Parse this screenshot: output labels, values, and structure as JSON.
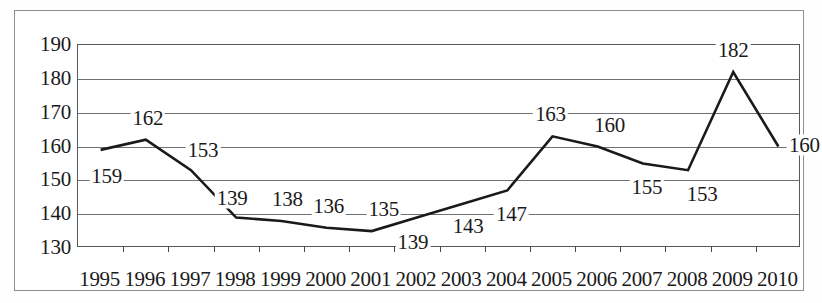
{
  "chart_data": {
    "type": "line",
    "title": "",
    "subtitle": "",
    "xlabel": "",
    "ylabel": "",
    "categories": [
      "1995",
      "1996",
      "1997",
      "1998",
      "1999",
      "2000",
      "2001",
      "2002",
      "2003",
      "2004",
      "2005",
      "2006",
      "2007",
      "2008",
      "2009",
      "2010"
    ],
    "values": [
      159,
      162,
      153,
      139,
      138,
      136,
      135,
      139,
      143,
      147,
      163,
      160,
      155,
      153,
      182,
      160
    ],
    "series": [
      {
        "name": "",
        "values": [
          159,
          162,
          153,
          139,
          138,
          136,
          135,
          139,
          143,
          147,
          163,
          160,
          155,
          153,
          182,
          160
        ]
      }
    ],
    "ylim": [
      130,
      190
    ],
    "yticks": [
      130,
      140,
      150,
      160,
      170,
      180,
      190
    ],
    "ytick_labels": [
      "130",
      "140",
      "150",
      "160",
      "170",
      "180",
      "190"
    ],
    "xtick_labels": [
      "1995",
      "1996",
      "1997",
      "1998",
      "1999",
      "2000",
      "2001",
      "2002",
      "2003",
      "2004",
      "2005",
      "2006",
      "2007",
      "2008",
      "2009",
      "2010"
    ],
    "data_labels": [
      "159",
      "162",
      "153",
      "139",
      "138",
      "136",
      "135",
      "139",
      "143",
      "147",
      "163",
      "160",
      "155",
      "153",
      "182",
      "160"
    ],
    "grid": true,
    "grid_axis": "y",
    "legend": false,
    "legend_position": "none",
    "line_color": "#1a1a1a",
    "grid_color": "#6d7176",
    "axis_color": "#54585d",
    "frame_color": "#8b8f95",
    "background_color": "#ffffff",
    "text_color": "#1a1a1a",
    "markers": false,
    "label_offsets": [
      {
        "dx": 6,
        "dy": 26
      },
      {
        "dx": 2,
        "dy": -22
      },
      {
        "dx": 12,
        "dy": -20
      },
      {
        "dx": -4,
        "dy": -20
      },
      {
        "dx": 6,
        "dy": -22
      },
      {
        "dx": 2,
        "dy": -22
      },
      {
        "dx": 12,
        "dy": -22
      },
      {
        "dx": -4,
        "dy": 24
      },
      {
        "dx": 6,
        "dy": 22
      },
      {
        "dx": 4,
        "dy": 24
      },
      {
        "dx": -2,
        "dy": -22
      },
      {
        "dx": 12,
        "dy": -22
      },
      {
        "dx": 4,
        "dy": 24
      },
      {
        "dx": 14,
        "dy": 24
      },
      {
        "dx": 0,
        "dy": -22
      },
      {
        "dx": 26,
        "dy": -2
      }
    ]
  }
}
